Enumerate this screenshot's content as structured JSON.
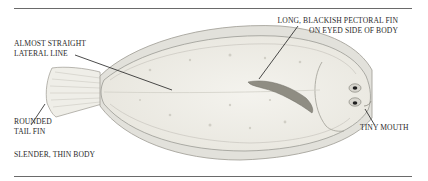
{
  "figure": {
    "colors": {
      "rule": "#6a6a6a",
      "text": "#2a2a2a",
      "body_fill": "#f1f0ea",
      "outline": "#9a9a94",
      "pectoral_fin": "#8c8a80",
      "leader": "#1e1e1e"
    }
  },
  "labels": {
    "lateral_line": {
      "line1": "ALMOST STRAIGHT",
      "line2": "LATERAL LINE"
    },
    "pectoral_fin": {
      "line1": "LONG, BLACKISH PECTORAL FIN",
      "line2": "ON EYED SIDE OF BODY"
    },
    "tail_fin": {
      "line1": "ROUNDED",
      "line2": "TAIL FIN"
    },
    "mouth": {
      "line1": "TINY MOUTH"
    },
    "body": {
      "line1": "SLENDER, THIN BODY"
    }
  }
}
